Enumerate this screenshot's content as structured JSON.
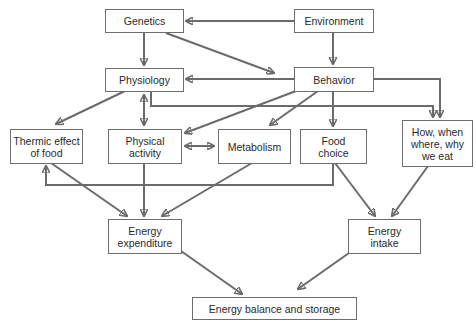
{
  "diagram": {
    "type": "flowchart",
    "colors": {
      "line": "#6b6b6b",
      "box_border": "#6e6e6e",
      "text": "#2a2a2a",
      "background": "#ffffff"
    },
    "nodes": {
      "genetics": {
        "label": "Genetics"
      },
      "environment": {
        "label": "Environment"
      },
      "physiology": {
        "label": "Physiology"
      },
      "behavior": {
        "label": "Behavior"
      },
      "thermic": {
        "label": "Thermic effect\nof food"
      },
      "physical": {
        "label": "Physical\nactivity"
      },
      "metabolism": {
        "label": "Metabolism"
      },
      "food_choice": {
        "label": "Food\nchoice"
      },
      "how_when": {
        "label": "How, when\nwhere, why\nwe eat"
      },
      "expenditure": {
        "label": "Energy\nexpenditure"
      },
      "intake": {
        "label": "Energy\nintake"
      },
      "balance": {
        "label": "Energy balance and storage"
      }
    },
    "edges": [
      {
        "from": "Environment",
        "to": "Genetics"
      },
      {
        "from": "Environment",
        "to": "Behavior"
      },
      {
        "from": "Genetics",
        "to": "Physiology"
      },
      {
        "from": "Genetics",
        "to": "Behavior"
      },
      {
        "from": "Behavior",
        "to": "Physiology"
      },
      {
        "from": "Physiology",
        "to": "Thermic effect of food"
      },
      {
        "from": "Physiology",
        "to": "Physical activity",
        "bidirectional": true
      },
      {
        "from": "Physiology",
        "to": "How, when where, why we eat"
      },
      {
        "from": "Behavior",
        "to": "How, when where, why we eat"
      },
      {
        "from": "Behavior",
        "to": "Physical activity"
      },
      {
        "from": "Behavior",
        "to": "Metabolism"
      },
      {
        "from": "Behavior",
        "to": "Food choice"
      },
      {
        "from": "Physical activity",
        "to": "Metabolism",
        "bidirectional": true
      },
      {
        "from": "Food choice",
        "to": "Thermic effect of food"
      },
      {
        "from": "Thermic effect of food",
        "to": "Energy expenditure"
      },
      {
        "from": "Physical activity",
        "to": "Energy expenditure"
      },
      {
        "from": "Metabolism",
        "to": "Energy expenditure"
      },
      {
        "from": "Food choice",
        "to": "Energy intake"
      },
      {
        "from": "How, when where, why we eat",
        "to": "Energy intake"
      },
      {
        "from": "Energy expenditure",
        "to": "Energy balance and storage"
      },
      {
        "from": "Energy intake",
        "to": "Energy balance and storage"
      }
    ]
  }
}
